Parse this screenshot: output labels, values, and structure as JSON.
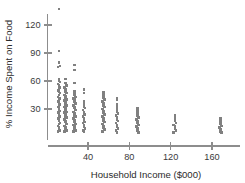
{
  "chart_data": {
    "type": "scatter",
    "title": "",
    "subtitle": "",
    "xlabel": "Household Income ($000)",
    "ylabel": "% Income Spent on Food",
    "xlim": [
      0,
      186
    ],
    "ylim": [
      0,
      140
    ],
    "xticks": [
      40,
      80,
      120,
      160
    ],
    "xtick_labels": [
      "40",
      "80",
      "120",
      "160"
    ],
    "yticks": [
      30,
      60,
      90,
      120
    ],
    "ytick_labels": [
      "30",
      "60",
      "90",
      "120"
    ],
    "grid": false,
    "legend": null,
    "marker_color": "#808080",
    "axis_color": "#8d8d8d",
    "marker_shape": "square",
    "annotations": [],
    "series": [
      {
        "name": "Households",
        "points": [
          [
            12,
            137
          ],
          [
            12,
            92
          ],
          [
            12,
            80
          ],
          [
            13,
            76
          ],
          [
            11,
            75
          ],
          [
            12,
            62
          ],
          [
            12,
            60
          ],
          [
            13,
            59
          ],
          [
            11,
            57
          ],
          [
            12,
            55
          ],
          [
            13,
            53
          ],
          [
            12,
            52
          ],
          [
            11,
            50
          ],
          [
            12,
            49
          ],
          [
            13,
            47
          ],
          [
            12,
            45
          ],
          [
            11,
            43
          ],
          [
            12,
            42
          ],
          [
            13,
            41
          ],
          [
            12,
            39
          ],
          [
            11,
            38
          ],
          [
            12,
            36
          ],
          [
            13,
            35
          ],
          [
            12,
            34
          ],
          [
            11,
            32
          ],
          [
            12,
            31
          ],
          [
            12,
            29
          ],
          [
            13,
            28
          ],
          [
            11,
            26
          ],
          [
            12,
            25
          ],
          [
            12,
            23
          ],
          [
            13,
            22
          ],
          [
            11,
            20
          ],
          [
            12,
            19
          ],
          [
            12,
            17
          ],
          [
            13,
            15
          ],
          [
            12,
            14
          ],
          [
            11,
            12
          ],
          [
            12,
            10
          ],
          [
            12,
            8
          ],
          [
            13,
            7
          ],
          [
            11,
            6
          ],
          [
            18,
            62
          ],
          [
            18,
            58
          ],
          [
            19,
            55
          ],
          [
            17,
            53
          ],
          [
            18,
            51
          ],
          [
            18,
            49
          ],
          [
            19,
            47
          ],
          [
            17,
            45
          ],
          [
            18,
            44
          ],
          [
            18,
            42
          ],
          [
            19,
            40
          ],
          [
            17,
            39
          ],
          [
            18,
            37
          ],
          [
            18,
            35
          ],
          [
            19,
            34
          ],
          [
            17,
            32
          ],
          [
            18,
            31
          ],
          [
            18,
            29
          ],
          [
            19,
            27
          ],
          [
            17,
            26
          ],
          [
            18,
            24
          ],
          [
            18,
            22
          ],
          [
            19,
            21
          ],
          [
            17,
            19
          ],
          [
            18,
            17
          ],
          [
            18,
            16
          ],
          [
            19,
            14
          ],
          [
            17,
            12
          ],
          [
            18,
            10
          ],
          [
            18,
            8
          ],
          [
            19,
            7
          ],
          [
            17,
            6
          ],
          [
            27,
            77
          ],
          [
            27,
            72
          ],
          [
            27,
            58
          ],
          [
            27,
            49
          ],
          [
            27,
            47
          ],
          [
            27,
            45
          ],
          [
            28,
            43
          ],
          [
            26,
            41
          ],
          [
            27,
            40
          ],
          [
            27,
            38
          ],
          [
            28,
            36
          ],
          [
            26,
            34
          ],
          [
            27,
            32
          ],
          [
            27,
            31
          ],
          [
            28,
            29
          ],
          [
            26,
            27
          ],
          [
            27,
            25
          ],
          [
            27,
            23
          ],
          [
            28,
            22
          ],
          [
            26,
            20
          ],
          [
            27,
            18
          ],
          [
            27,
            16
          ],
          [
            28,
            14
          ],
          [
            26,
            13
          ],
          [
            27,
            11
          ],
          [
            27,
            9
          ],
          [
            28,
            7
          ],
          [
            26,
            6
          ],
          [
            36,
            51
          ],
          [
            36,
            47
          ],
          [
            36,
            38
          ],
          [
            36,
            36
          ],
          [
            36,
            34
          ],
          [
            36,
            32
          ],
          [
            37,
            31
          ],
          [
            35,
            29
          ],
          [
            36,
            27
          ],
          [
            36,
            25
          ],
          [
            37,
            24
          ],
          [
            35,
            22
          ],
          [
            36,
            20
          ],
          [
            36,
            18
          ],
          [
            37,
            16
          ],
          [
            35,
            15
          ],
          [
            36,
            13
          ],
          [
            36,
            11
          ],
          [
            37,
            9
          ],
          [
            35,
            7
          ],
          [
            36,
            6
          ],
          [
            55,
            48
          ],
          [
            55,
            46
          ],
          [
            55,
            44
          ],
          [
            55,
            42
          ],
          [
            56,
            40
          ],
          [
            54,
            38
          ],
          [
            55,
            36
          ],
          [
            55,
            34
          ],
          [
            56,
            32
          ],
          [
            54,
            30
          ],
          [
            55,
            28
          ],
          [
            55,
            26
          ],
          [
            56,
            24
          ],
          [
            54,
            22
          ],
          [
            55,
            20
          ],
          [
            55,
            18
          ],
          [
            56,
            16
          ],
          [
            54,
            14
          ],
          [
            55,
            12
          ],
          [
            55,
            10
          ],
          [
            56,
            8
          ],
          [
            54,
            6
          ],
          [
            68,
            42
          ],
          [
            68,
            40
          ],
          [
            68,
            35
          ],
          [
            68,
            33
          ],
          [
            68,
            31
          ],
          [
            68,
            29
          ],
          [
            68,
            27
          ],
          [
            69,
            25
          ],
          [
            67,
            23
          ],
          [
            68,
            21
          ],
          [
            68,
            19
          ],
          [
            69,
            17
          ],
          [
            67,
            15
          ],
          [
            68,
            13
          ],
          [
            68,
            11
          ],
          [
            69,
            9
          ],
          [
            67,
            7
          ],
          [
            68,
            5
          ],
          [
            88,
            31
          ],
          [
            88,
            29
          ],
          [
            88,
            27
          ],
          [
            88,
            25
          ],
          [
            88,
            23
          ],
          [
            89,
            21
          ],
          [
            87,
            19
          ],
          [
            88,
            17
          ],
          [
            88,
            15
          ],
          [
            89,
            13
          ],
          [
            87,
            11
          ],
          [
            88,
            9
          ],
          [
            88,
            7
          ],
          [
            89,
            5
          ],
          [
            124,
            23
          ],
          [
            124,
            21
          ],
          [
            124,
            19
          ],
          [
            124,
            17
          ],
          [
            125,
            15
          ],
          [
            123,
            13
          ],
          [
            124,
            11
          ],
          [
            124,
            9
          ],
          [
            125,
            7
          ],
          [
            123,
            5
          ],
          [
            168,
            20
          ],
          [
            168,
            18
          ],
          [
            168,
            16
          ],
          [
            168,
            14
          ],
          [
            169,
            12
          ],
          [
            167,
            10
          ],
          [
            168,
            8
          ],
          [
            168,
            6
          ],
          [
            169,
            5
          ]
        ]
      }
    ]
  }
}
